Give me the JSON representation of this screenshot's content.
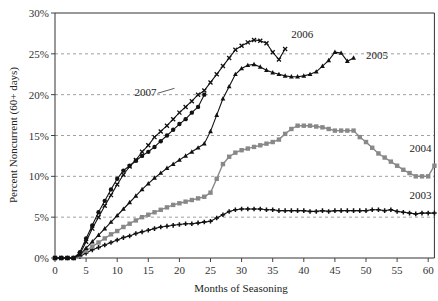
{
  "chart_data": {
    "type": "line",
    "title": "",
    "xlabel": "Months of Seasoning",
    "ylabel": "Percent Noncurrent (60+ days)",
    "xlim": [
      0,
      61
    ],
    "ylim": [
      0,
      30
    ],
    "x_ticks": [
      0,
      5,
      10,
      15,
      20,
      25,
      30,
      35,
      40,
      45,
      50,
      55,
      60
    ],
    "y_ticks": [
      0,
      5,
      10,
      15,
      20,
      25,
      30
    ],
    "y_tick_labels": [
      "0%",
      "5%",
      "10%",
      "15%",
      "20%",
      "25%",
      "30%"
    ],
    "grid": "horizontal dashed",
    "legend": "inline labels",
    "series": [
      {
        "name": "2003",
        "marker": "plus",
        "color": "#111111",
        "label_pos": [
          57,
          7.2
        ],
        "x": [
          0,
          1,
          2,
          3,
          4,
          5,
          6,
          7,
          8,
          9,
          10,
          11,
          12,
          13,
          14,
          15,
          16,
          17,
          18,
          19,
          20,
          21,
          22,
          23,
          24,
          25,
          26,
          27,
          28,
          29,
          30,
          31,
          32,
          33,
          34,
          35,
          36,
          37,
          38,
          39,
          40,
          41,
          42,
          43,
          44,
          45,
          46,
          47,
          48,
          49,
          50,
          51,
          52,
          53,
          54,
          55,
          56,
          57,
          58,
          59,
          60,
          61
        ],
        "values": [
          0,
          0,
          0,
          0,
          0.2,
          0.6,
          1.0,
          1.3,
          1.6,
          1.9,
          2.2,
          2.5,
          2.7,
          3.0,
          3.2,
          3.4,
          3.6,
          3.8,
          3.9,
          4.0,
          4.1,
          4.2,
          4.2,
          4.3,
          4.4,
          4.5,
          4.9,
          5.3,
          5.7,
          5.9,
          6.0,
          6.0,
          6.0,
          6.0,
          5.9,
          5.9,
          5.8,
          5.8,
          5.8,
          5.8,
          5.8,
          5.7,
          5.7,
          5.8,
          5.7,
          5.8,
          5.8,
          5.8,
          5.8,
          5.8,
          5.8,
          5.9,
          5.9,
          5.8,
          5.9,
          5.7,
          5.6,
          5.5,
          5.4,
          5.5,
          5.5,
          5.5
        ]
      },
      {
        "name": "2004",
        "marker": "square",
        "color": "#888888",
        "label_pos": [
          57,
          13.0
        ],
        "x": [
          0,
          1,
          2,
          3,
          4,
          5,
          6,
          7,
          8,
          9,
          10,
          11,
          12,
          13,
          14,
          15,
          16,
          17,
          18,
          19,
          20,
          21,
          22,
          23,
          24,
          25,
          26,
          27,
          28,
          29,
          30,
          31,
          32,
          33,
          34,
          35,
          36,
          37,
          38,
          39,
          40,
          41,
          42,
          43,
          44,
          45,
          46,
          47,
          48,
          49,
          50,
          51,
          52,
          53,
          54,
          55,
          56,
          57,
          58,
          59,
          60,
          61
        ],
        "values": [
          0,
          0,
          0,
          0,
          0.3,
          0.9,
          1.4,
          1.9,
          2.4,
          2.9,
          3.3,
          3.8,
          4.2,
          4.6,
          5.0,
          5.3,
          5.6,
          5.9,
          6.2,
          6.5,
          6.7,
          6.9,
          7.1,
          7.3,
          7.5,
          8.0,
          9.7,
          11.5,
          12.4,
          12.9,
          13.2,
          13.4,
          13.6,
          13.8,
          14.0,
          14.2,
          14.5,
          15.2,
          15.8,
          16.2,
          16.2,
          16.2,
          16.1,
          16.0,
          15.8,
          15.6,
          15.6,
          15.6,
          15.6,
          14.8,
          14.2,
          13.5,
          12.8,
          12.3,
          11.8,
          11.3,
          10.8,
          10.4,
          10.0,
          10.0,
          10.0,
          11.3
        ]
      },
      {
        "name": "2005",
        "marker": "triangle",
        "color": "#111111",
        "label_pos": [
          50,
          24.4
        ],
        "x": [
          0,
          1,
          2,
          3,
          4,
          5,
          6,
          7,
          8,
          9,
          10,
          11,
          12,
          13,
          14,
          15,
          16,
          17,
          18,
          19,
          20,
          21,
          22,
          23,
          24,
          25,
          26,
          27,
          28,
          29,
          30,
          31,
          32,
          33,
          34,
          35,
          36,
          37,
          38,
          39,
          40,
          41,
          42,
          43,
          44,
          45,
          46,
          47,
          48
        ],
        "values": [
          0,
          0,
          0,
          0,
          0.4,
          1.2,
          2.0,
          2.8,
          3.6,
          4.4,
          5.2,
          6.0,
          6.8,
          7.6,
          8.4,
          9.1,
          9.8,
          10.4,
          11.0,
          11.5,
          12.0,
          12.5,
          13.0,
          13.5,
          14.0,
          15.5,
          17.5,
          19.5,
          21.0,
          22.5,
          23.2,
          23.6,
          23.7,
          23.4,
          23.0,
          22.7,
          22.5,
          22.3,
          22.2,
          22.2,
          22.3,
          22.5,
          22.8,
          23.5,
          24.2,
          25.2,
          25.1,
          24.1,
          24.5
        ]
      },
      {
        "name": "2006",
        "marker": "cross",
        "color": "#111111",
        "label_pos": [
          38,
          27.0
        ],
        "x": [
          0,
          1,
          2,
          3,
          4,
          5,
          6,
          7,
          8,
          9,
          10,
          11,
          12,
          13,
          14,
          15,
          16,
          17,
          18,
          19,
          20,
          21,
          22,
          23,
          24,
          25,
          26,
          27,
          28,
          29,
          30,
          31,
          32,
          33,
          34,
          35,
          36,
          37
        ],
        "values": [
          0,
          0,
          0,
          0,
          0.5,
          2.0,
          3.6,
          5.0,
          6.4,
          7.7,
          9.0,
          10.2,
          11.2,
          12.0,
          13.0,
          13.8,
          14.8,
          15.5,
          16.2,
          17.0,
          17.8,
          18.5,
          19.2,
          20.0,
          20.5,
          21.5,
          22.5,
          23.5,
          24.5,
          25.5,
          26.0,
          26.4,
          26.7,
          26.6,
          26.3,
          25.2,
          24.3,
          25.6
        ]
      },
      {
        "name": "2007",
        "marker": "circle",
        "color": "#111111",
        "label_pos": [
          16,
          19.8
        ],
        "x": [
          0,
          1,
          2,
          3,
          4,
          5,
          6,
          7,
          8,
          9,
          10,
          11,
          12,
          13,
          14,
          15,
          16,
          17,
          18,
          19,
          20,
          21,
          22,
          23,
          24
        ],
        "values": [
          0,
          0,
          0,
          0,
          0.7,
          2.4,
          4.0,
          5.6,
          7.0,
          8.4,
          9.7,
          10.7,
          11.3,
          11.9,
          12.5,
          13.0,
          13.6,
          14.3,
          15.0,
          15.7,
          16.4,
          17.0,
          17.8,
          18.5,
          20.0
        ]
      }
    ]
  }
}
